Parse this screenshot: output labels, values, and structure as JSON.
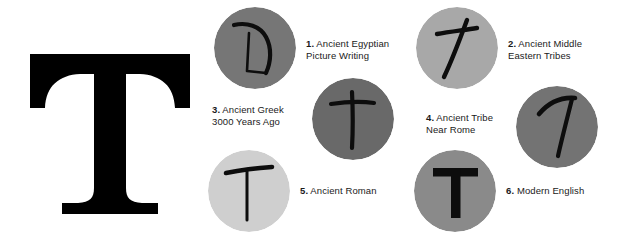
{
  "diagram": {
    "background_color": "#ffffff",
    "ink_color": "#000000",
    "hero": {
      "letter": "T",
      "style": "slab-serif",
      "color": "#000000"
    },
    "stages": [
      {
        "number": "1.",
        "label_line1": "Ancient Egyptian",
        "label_line2": "Picture Writing",
        "glyph_name": "egyptian-picture-writing-glyph",
        "circle_color": "#767676",
        "label_side": "right"
      },
      {
        "number": "2.",
        "label_line1": "Ancient Middle",
        "label_line2": "Eastern Tribes",
        "glyph_name": "middle-eastern-cross-glyph",
        "circle_color": "#a8a8a8",
        "label_side": "right"
      },
      {
        "number": "3.",
        "label_line1": "Ancient Greek",
        "label_line2": "3000 Years Ago",
        "glyph_name": "greek-tau-cross-glyph",
        "circle_color": "#696969",
        "label_side": "left"
      },
      {
        "number": "4.",
        "label_line1": "Ancient Tribe",
        "label_line2": "Near Rome",
        "glyph_name": "roman-tribe-tilted-t-glyph",
        "circle_color": "#737373",
        "label_side": "left"
      },
      {
        "number": "5.",
        "label_line1": "Ancient Roman",
        "label_line2": "",
        "glyph_name": "ancient-roman-t-glyph",
        "circle_color": "#cfcfcf",
        "label_side": "right"
      },
      {
        "number": "6.",
        "label_line1": "Modern English",
        "label_line2": "",
        "glyph_name": "modern-english-t-glyph",
        "circle_color": "#8a8a8a",
        "label_side": "right"
      }
    ]
  }
}
